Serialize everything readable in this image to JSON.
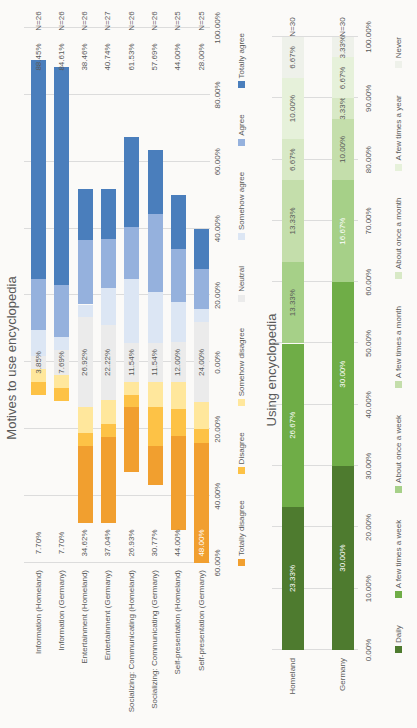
{
  "page": {
    "background": "#f3f1ee"
  },
  "chart_data": [
    {
      "type": "bar",
      "subtype": "diverging-stacked-horizontal",
      "title": "Motives to use encyclopedia",
      "xlabel": "",
      "ylabel": "",
      "axis_range": [
        -60,
        100
      ],
      "grid": true,
      "legend_position": "bottom",
      "axis_ticks": [
        {
          "value": -60,
          "label": "60.00%"
        },
        {
          "value": -40,
          "label": "40.00%"
        },
        {
          "value": -20,
          "label": "20.00%"
        },
        {
          "value": 0,
          "label": "0.00%"
        },
        {
          "value": 20,
          "label": "20.00%"
        },
        {
          "value": 40,
          "label": "40.00%"
        },
        {
          "value": 60,
          "label": "60.00%"
        },
        {
          "value": 80,
          "label": "80.00%"
        },
        {
          "value": 100,
          "label": "100.00%"
        }
      ],
      "series_legend": [
        {
          "key": "totally_disagree",
          "label": "Totally disagree",
          "color": "#f19f2f"
        },
        {
          "key": "disagree",
          "label": "Disagree",
          "color": "#fdc246"
        },
        {
          "key": "somehow_disagree",
          "label": "Somehow disagree",
          "color": "#ffe79c"
        },
        {
          "key": "neutral",
          "label": "Neutral",
          "color": "#ebebeb"
        },
        {
          "key": "somehow_agree",
          "label": "Somehow agree",
          "color": "#dce6f4"
        },
        {
          "key": "agree",
          "label": "Agree",
          "color": "#95b1dd"
        },
        {
          "key": "totally_agree",
          "label": "Totally agree",
          "color": "#4a7ebc"
        }
      ],
      "categories": [
        {
          "label": "Information (Homeland)",
          "n_label": "N=26",
          "disagree_total_label": "7.70%",
          "neutral_label": "3.85%",
          "agree_total_label": "88.45%",
          "disagree_label_white": false,
          "segments": {
            "totally_disagree": 0,
            "disagree": 3.85,
            "somehow_disagree": 3.85,
            "neutral": 3.85,
            "somehow_agree": 7.69,
            "agree": 15.38,
            "totally_agree": 65.38
          }
        },
        {
          "label": "Information (Germany)",
          "n_label": "N=26",
          "disagree_total_label": "7.70%",
          "neutral_label": "7.69%",
          "agree_total_label": "84.61%",
          "disagree_label_white": false,
          "segments": {
            "totally_disagree": 0,
            "disagree": 3.85,
            "somehow_disagree": 3.85,
            "neutral": 7.69,
            "somehow_agree": 3.85,
            "agree": 15.38,
            "totally_agree": 65.38
          }
        },
        {
          "label": "Entertainment (Homeland)",
          "n_label": "N=26",
          "disagree_total_label": "34.62%",
          "neutral_label": "26.92%",
          "agree_total_label": "38.46%",
          "disagree_label_white": false,
          "segments": {
            "totally_disagree": 23.08,
            "disagree": 3.85,
            "somehow_disagree": 7.69,
            "neutral": 26.92,
            "somehow_agree": 3.85,
            "agree": 19.23,
            "totally_agree": 15.38
          }
        },
        {
          "label": "Entertainment (Germany)",
          "n_label": "N=27",
          "disagree_total_label": "37.04%",
          "neutral_label": "22.22%",
          "agree_total_label": "40.74%",
          "disagree_label_white": false,
          "segments": {
            "totally_disagree": 25.93,
            "disagree": 3.7,
            "somehow_disagree": 7.41,
            "neutral": 22.22,
            "somehow_agree": 11.11,
            "agree": 14.81,
            "totally_agree": 14.81
          }
        },
        {
          "label": "Socializing: Communicating (Homeland)",
          "n_label": "N=26",
          "disagree_total_label": "26.93%",
          "neutral_label": "11.54%",
          "agree_total_label": "61.53%",
          "disagree_label_white": false,
          "segments": {
            "totally_disagree": 19.23,
            "disagree": 3.85,
            "somehow_disagree": 3.85,
            "neutral": 11.54,
            "somehow_agree": 19.23,
            "agree": 15.38,
            "totally_agree": 26.92
          }
        },
        {
          "label": "Socializing: Communicating (Germany)",
          "n_label": "N=26",
          "disagree_total_label": "30.77%",
          "neutral_label": "11.54%",
          "agree_total_label": "57.69%",
          "disagree_label_white": false,
          "segments": {
            "totally_disagree": 11.54,
            "disagree": 11.54,
            "somehow_disagree": 7.69,
            "neutral": 11.54,
            "somehow_agree": 15.38,
            "agree": 23.08,
            "totally_agree": 19.23
          }
        },
        {
          "label": "Self-presentation (Homeland)",
          "n_label": "N=25",
          "disagree_total_label": "44.00%",
          "neutral_label": "12.00%",
          "agree_total_label": "44.00%",
          "disagree_label_white": false,
          "segments": {
            "totally_disagree": 28.0,
            "disagree": 8.0,
            "somehow_disagree": 8.0,
            "neutral": 12.0,
            "somehow_agree": 12.0,
            "agree": 16.0,
            "totally_agree": 16.0
          }
        },
        {
          "label": "Self-presentation (Germany)",
          "n_label": "N=25",
          "disagree_total_label": "48.00%",
          "neutral_label": "24.00%",
          "agree_total_label": "28.00%",
          "disagree_label_white": true,
          "segments": {
            "totally_disagree": 36.0,
            "disagree": 4.0,
            "somehow_disagree": 8.0,
            "neutral": 24.0,
            "somehow_agree": 4.0,
            "agree": 12.0,
            "totally_agree": 12.0
          }
        }
      ]
    },
    {
      "type": "bar",
      "subtype": "100pct-stacked-horizontal",
      "title": "Using encyclopedia",
      "xlabel": "",
      "ylabel": "",
      "axis_range": [
        0,
        100
      ],
      "grid": true,
      "legend_position": "bottom",
      "axis_ticks": [
        {
          "value": 0,
          "label": "0.00%"
        },
        {
          "value": 10,
          "label": "10.00%"
        },
        {
          "value": 20,
          "label": "20.00%"
        },
        {
          "value": 30,
          "label": "30.00%"
        },
        {
          "value": 40,
          "label": "40.00%"
        },
        {
          "value": 50,
          "label": "50.00%"
        },
        {
          "value": 60,
          "label": "60.00%"
        },
        {
          "value": 70,
          "label": "70.00%"
        },
        {
          "value": 80,
          "label": "80.00%"
        },
        {
          "value": 90,
          "label": "90.00%"
        },
        {
          "value": 100,
          "label": "100.00%"
        }
      ],
      "series_legend": [
        {
          "label": "Daily",
          "color": "#4e7b2f"
        },
        {
          "label": "A few times a week",
          "color": "#6fad47"
        },
        {
          "label": "About once a week",
          "color": "#a6d088"
        },
        {
          "label": "A few times a month",
          "color": "#c4deab"
        },
        {
          "label": "About once a month",
          "color": "#d8e9c6"
        },
        {
          "label": "A few times a year",
          "color": "#e6f1da"
        },
        {
          "label": "Never",
          "color": "#eef1ea"
        }
      ],
      "rows": [
        {
          "label": "Homeland",
          "n_label": "N=30",
          "values": [
            23.33,
            26.67,
            13.33,
            13.33,
            6.67,
            10.0,
            6.67
          ],
          "white_labels": [
            true,
            true,
            false,
            false,
            false,
            false,
            false
          ]
        },
        {
          "label": "Germany",
          "n_label": "N=30",
          "values": [
            30.0,
            30.0,
            16.67,
            10.0,
            3.33,
            6.67,
            3.33
          ],
          "white_labels": [
            true,
            true,
            true,
            false,
            false,
            false,
            false
          ]
        }
      ]
    }
  ]
}
